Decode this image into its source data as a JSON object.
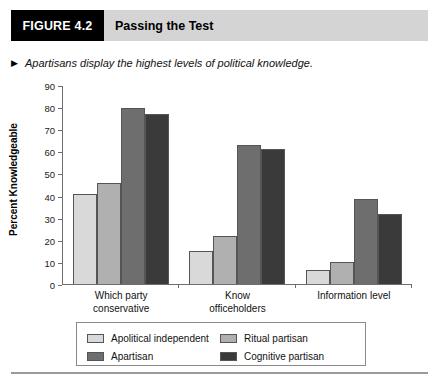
{
  "figure": {
    "tag": "FIGURE 4.2",
    "title": "Passing the Test",
    "caption_marker": "▶",
    "caption": "Apartisans display the highest levels of political knowledge."
  },
  "colors": {
    "tag_background": "#000000",
    "title_background": "#d4d4d4",
    "series": [
      "#d9d9d9",
      "#b0b0b0",
      "#6e6e6e",
      "#3a3a3a"
    ],
    "axis": "#6d6d6d"
  },
  "chart_data": {
    "type": "bar",
    "title": "Passing the Test",
    "xlabel": "",
    "ylabel": "Percent Knowledgeable",
    "ylim": [
      0,
      90
    ],
    "yticks": [
      "0",
      "10",
      "20",
      "30",
      "40",
      "50",
      "60",
      "70",
      "80",
      "90"
    ],
    "grid": false,
    "legend_position": "bottom",
    "categories": [
      "Which party conservative",
      "Know officeholders",
      "Information level"
    ],
    "category_lines": [
      [
        "Which party",
        "conservative"
      ],
      [
        "Know",
        "officeholders"
      ],
      [
        "Information level"
      ]
    ],
    "series": [
      {
        "name": "Apolitical independent",
        "color": "#d9d9d9",
        "values": [
          41,
          15,
          6.5
        ]
      },
      {
        "name": "Ritual partisan",
        "color": "#b0b0b0",
        "values": [
          46,
          22,
          10
        ]
      },
      {
        "name": "Apartisan",
        "color": "#6e6e6e",
        "values": [
          80,
          63,
          38.5
        ]
      },
      {
        "name": "Cognitive partisan",
        "color": "#3a3a3a",
        "values": [
          77.5,
          61.5,
          32
        ]
      }
    ]
  },
  "legend": {
    "entries": [
      {
        "label": "Apolitical independent",
        "color": "#d9d9d9"
      },
      {
        "label": "Ritual partisan",
        "color": "#b0b0b0"
      },
      {
        "label": "Apartisan",
        "color": "#6e6e6e"
      },
      {
        "label": "Cognitive partisan",
        "color": "#3a3a3a"
      }
    ]
  }
}
